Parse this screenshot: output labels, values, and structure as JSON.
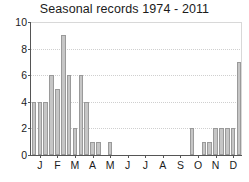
{
  "chart_data": {
    "type": "bar",
    "title": "Seasonal records 1974 - 2011",
    "xlabel": "",
    "ylabel": "",
    "ylim": [
      0,
      10
    ],
    "y_ticks": [
      0,
      2,
      4,
      6,
      8,
      10
    ],
    "grid": true,
    "legend": "none",
    "month_labels": [
      "J",
      "F",
      "M",
      "A",
      "M",
      "J",
      "J",
      "A",
      "S",
      "O",
      "N",
      "D"
    ],
    "bin_note": "Each month is divided into 3 equal sub-period bars (36 bins total).",
    "categories": [
      "J-1",
      "J-2",
      "J-3",
      "F-1",
      "F-2",
      "F-3",
      "M-1",
      "M-2",
      "M-3",
      "A-1",
      "A-2",
      "A-3",
      "M-1",
      "M-2",
      "M-3",
      "J-1",
      "J-2",
      "J-3",
      "J-1",
      "J-2",
      "J-3",
      "A-1",
      "A-2",
      "A-3",
      "S-1",
      "S-2",
      "S-3",
      "O-1",
      "O-2",
      "O-3",
      "N-1",
      "N-2",
      "N-3",
      "D-1",
      "D-2",
      "D-3"
    ],
    "values": [
      4,
      4,
      4,
      6,
      5,
      9,
      6,
      2,
      6,
      4,
      1,
      1,
      0,
      1,
      0,
      0,
      0,
      0,
      0,
      0,
      0,
      0,
      0,
      0,
      0,
      0,
      0,
      2,
      0,
      1,
      1,
      2,
      2,
      2,
      2,
      7
    ]
  },
  "colors": {
    "bar_fill": "#c6c6c6",
    "bar_stroke": "#9a9a9a",
    "axis": "#555555",
    "grid": "#cfcfcf",
    "text": "#1b1b1b",
    "background": "#ffffff"
  }
}
